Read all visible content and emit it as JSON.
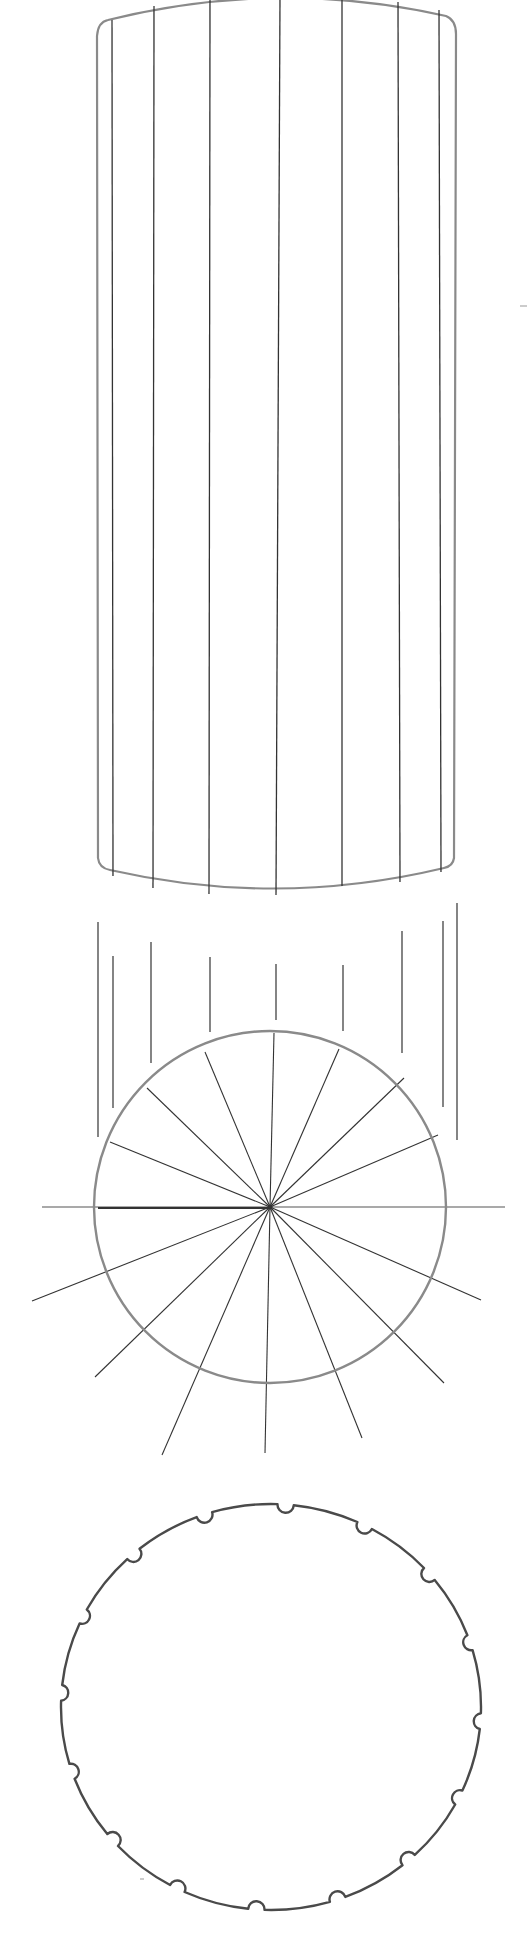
{
  "image": {
    "title": "Pencil sketch: fluted cylinder, radial division of circle, scalloped circle",
    "width": 530,
    "height": 1960,
    "background": "#ffffff"
  },
  "colors": {
    "outline": "#8a8a8a",
    "line_dark": "#333333",
    "line_mid": "#555555",
    "scallop": "#4a4a4a"
  },
  "cylinder": {
    "left_x": 98,
    "right_x": 456,
    "top_corner_y_left": 22,
    "top_corner_y_right": 20,
    "top_mid_y": -8,
    "bottom_corner_y_left": 868,
    "bottom_corner_y_right": 866,
    "bottom_mid_y": 896,
    "flutes": [
      {
        "x_top": 112,
        "x_bottom": 113,
        "y_top": 20,
        "y_bottom": 876
      },
      {
        "x_top": 154,
        "x_bottom": 153,
        "y_top": 6,
        "y_bottom": 888
      },
      {
        "x_top": 210,
        "x_bottom": 209,
        "y_top": -2,
        "y_bottom": 894
      },
      {
        "x_top": 280,
        "x_bottom": 276,
        "y_top": -4,
        "y_bottom": 895
      },
      {
        "x_top": 342,
        "x_bottom": 342,
        "y_top": -2,
        "y_bottom": 886
      },
      {
        "x_top": 398,
        "x_bottom": 400,
        "y_top": 2,
        "y_bottom": 882
      },
      {
        "x_top": 439,
        "x_bottom": 441,
        "y_top": 10,
        "y_bottom": 872
      }
    ]
  },
  "projection_lines": [
    {
      "x": 98,
      "y1": 922,
      "y2": 1137
    },
    {
      "x": 113,
      "y1": 956,
      "y2": 1108
    },
    {
      "x": 151,
      "y1": 942,
      "y2": 1063
    },
    {
      "x": 210,
      "y1": 957,
      "y2": 1032
    },
    {
      "x": 276,
      "y1": 964,
      "y2": 1020
    },
    {
      "x": 343,
      "y1": 965,
      "y2": 1031
    },
    {
      "x": 402,
      "y1": 931,
      "y2": 1053
    },
    {
      "x": 443,
      "y1": 921,
      "y2": 1107
    },
    {
      "x": 457,
      "y1": 903,
      "y2": 1140
    }
  ],
  "divided_circle": {
    "cx": 270,
    "cy": 1207,
    "r": 176,
    "horizontal_axis": {
      "x1": 42,
      "x2": 505
    },
    "rays": [
      {
        "x": 110,
        "y": 1142
      },
      {
        "x": 147,
        "y": 1088
      },
      {
        "x": 205,
        "y": 1052
      },
      {
        "x": 274,
        "y": 1033
      },
      {
        "x": 339,
        "y": 1049
      },
      {
        "x": 404,
        "y": 1078
      },
      {
        "x": 438,
        "y": 1135
      },
      {
        "x": 32,
        "y": 1301
      },
      {
        "x": 95,
        "y": 1377
      },
      {
        "x": 162,
        "y": 1455
      },
      {
        "x": 265,
        "y": 1453
      },
      {
        "x": 362,
        "y": 1438
      },
      {
        "x": 444,
        "y": 1383
      },
      {
        "x": 481,
        "y": 1300
      }
    ]
  },
  "scalloped_circle": {
    "cx": 271,
    "cy": 1707,
    "rx": 210,
    "ry": 203,
    "notch_count": 16,
    "notch_radius": 8,
    "start_angle_deg": -86
  },
  "stray_marks": [
    {
      "x1": 520,
      "y1": 306,
      "x2": 527,
      "y2": 306
    },
    {
      "x1": 140,
      "y1": 1879,
      "x2": 144,
      "y2": 1879
    }
  ]
}
